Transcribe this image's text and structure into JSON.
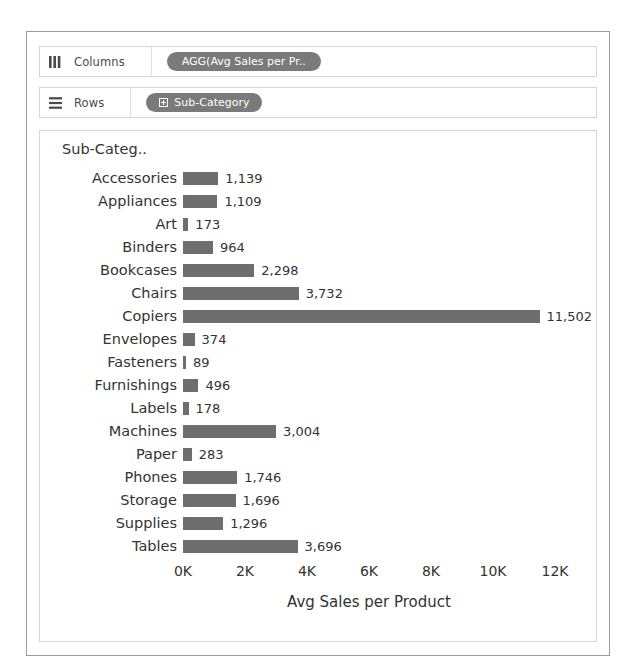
{
  "shelves": [
    {
      "name": "columns",
      "icon": "columns-icon",
      "label": "Columns",
      "pill": {
        "text": "AGG(Avg Sales per Pr..",
        "has_expand": false
      }
    },
    {
      "name": "rows",
      "icon": "rows-icon",
      "label": "Rows",
      "pill": {
        "text": "Sub-Category",
        "has_expand": true
      }
    }
  ],
  "chart_data": {
    "type": "bar",
    "orientation": "horizontal",
    "title": "",
    "row_header": "Sub-Categ..",
    "xlabel": "Avg Sales per Product",
    "ylabel": "Sub-Category",
    "xlim": [
      0,
      12400
    ],
    "xticks": [
      0,
      2000,
      4000,
      6000,
      8000,
      10000,
      12000
    ],
    "xticklabels": [
      "0K",
      "2K",
      "4K",
      "6K",
      "8K",
      "10K",
      "12K"
    ],
    "grid": false,
    "legend": "none",
    "bar_color": "#6e6e6e",
    "categories": [
      "Accessories",
      "Appliances",
      "Art",
      "Binders",
      "Bookcases",
      "Chairs",
      "Copiers",
      "Envelopes",
      "Fasteners",
      "Furnishings",
      "Labels",
      "Machines",
      "Paper",
      "Phones",
      "Storage",
      "Supplies",
      "Tables"
    ],
    "values": [
      1139,
      1109,
      173,
      964,
      2298,
      3732,
      11502,
      374,
      89,
      496,
      178,
      3004,
      283,
      1746,
      1696,
      1296,
      3696
    ],
    "value_labels": [
      "1,139",
      "1,109",
      "173",
      "964",
      "2,298",
      "3,732",
      "11,502",
      "374",
      "89",
      "496",
      "178",
      "3,004",
      "283",
      "1,746",
      "1,696",
      "1,296",
      "3,696"
    ]
  }
}
